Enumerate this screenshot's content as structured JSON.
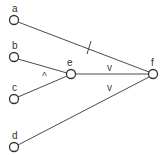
{
  "diagram": {
    "type": "directed-graph",
    "nodes": [
      {
        "id": "a",
        "label": "a",
        "x": 14,
        "y": 20
      },
      {
        "id": "b",
        "label": "b",
        "x": 14,
        "y": 57
      },
      {
        "id": "c",
        "label": "c",
        "x": 14,
        "y": 99
      },
      {
        "id": "d",
        "label": "d",
        "x": 14,
        "y": 147
      },
      {
        "id": "e",
        "label": "e",
        "x": 71,
        "y": 74
      },
      {
        "id": "f",
        "label": "f",
        "x": 153,
        "y": 74
      }
    ],
    "edges": [
      {
        "from": "a",
        "to": "f",
        "marker": "/"
      },
      {
        "from": "b",
        "to": "e",
        "marker": ""
      },
      {
        "from": "c",
        "to": "e",
        "marker": ""
      },
      {
        "from": "e",
        "to": "f",
        "marker": "v"
      },
      {
        "from": "d",
        "to": "f",
        "marker": ""
      }
    ],
    "markers": [
      {
        "symbol": "^",
        "x": 45,
        "y": 76,
        "between": [
          "b-e",
          "c-e"
        ]
      },
      {
        "symbol": "v",
        "x": 110,
        "y": 69,
        "between": [
          "a-f",
          "e-f"
        ]
      },
      {
        "symbol": "v",
        "x": 110,
        "y": 89,
        "between": [
          "e-f",
          "d-f"
        ]
      }
    ]
  }
}
